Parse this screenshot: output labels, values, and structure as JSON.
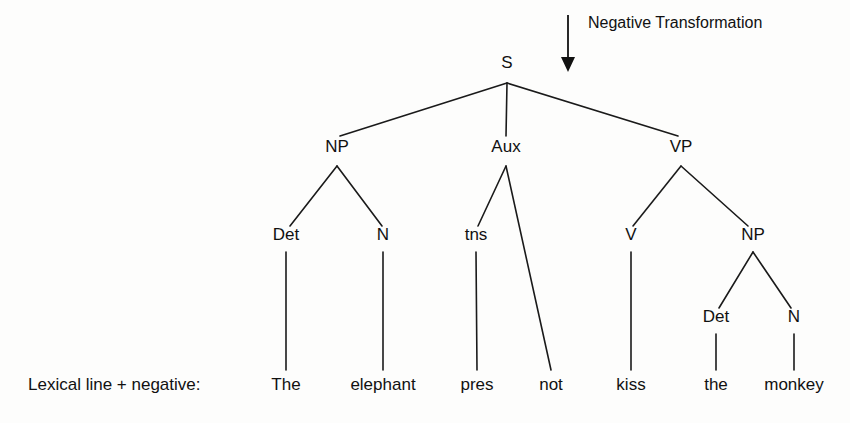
{
  "figure": {
    "background_color": "#fdfdfc",
    "ink_color": "#111111"
  },
  "annotation": {
    "label": "Negative Transformation",
    "label_x": 588,
    "label_y": 28,
    "arrow": {
      "name": "down-arrow",
      "x": 568,
      "y_start": 15,
      "y_end": 72
    }
  },
  "row_label": {
    "text": "Lexical line + negative:",
    "x": 28,
    "y": 390
  },
  "nodes": [
    {
      "id": "S",
      "label": "S",
      "x": 507,
      "y": 68,
      "type": "category"
    },
    {
      "id": "NP1",
      "label": "NP",
      "x": 337,
      "y": 152,
      "type": "category"
    },
    {
      "id": "Aux",
      "label": "Aux",
      "x": 506,
      "y": 152,
      "type": "category"
    },
    {
      "id": "VP",
      "label": "VP",
      "x": 681,
      "y": 152,
      "type": "category"
    },
    {
      "id": "Det1",
      "label": "Det",
      "x": 286,
      "y": 240,
      "type": "category"
    },
    {
      "id": "N1",
      "label": "N",
      "x": 383,
      "y": 240,
      "type": "category"
    },
    {
      "id": "tns",
      "label": "tns",
      "x": 476,
      "y": 240,
      "type": "category"
    },
    {
      "id": "V",
      "label": "V",
      "x": 631,
      "y": 240,
      "type": "category"
    },
    {
      "id": "NP2",
      "label": "NP",
      "x": 753,
      "y": 240,
      "type": "category"
    },
    {
      "id": "Det2",
      "label": "Det",
      "x": 716,
      "y": 322,
      "type": "category"
    },
    {
      "id": "N2",
      "label": "N",
      "x": 794,
      "y": 322,
      "type": "category"
    },
    {
      "id": "w_the1",
      "label": "The",
      "x": 286,
      "y": 390,
      "type": "terminal"
    },
    {
      "id": "w_eleph",
      "label": "elephant",
      "x": 383,
      "y": 390,
      "type": "terminal"
    },
    {
      "id": "w_pres",
      "label": "pres",
      "x": 477,
      "y": 390,
      "type": "terminal"
    },
    {
      "id": "w_not",
      "label": "not",
      "x": 551,
      "y": 390,
      "type": "terminal"
    },
    {
      "id": "w_kiss",
      "label": "kiss",
      "x": 631,
      "y": 390,
      "type": "terminal"
    },
    {
      "id": "w_the2",
      "label": "the",
      "x": 716,
      "y": 390,
      "type": "terminal"
    },
    {
      "id": "w_monkey",
      "label": "monkey",
      "x": 794,
      "y": 390,
      "type": "terminal"
    }
  ],
  "edges": [
    {
      "from": "S",
      "to": "NP1",
      "x1": 507,
      "y1": 83,
      "x2": 340,
      "y2": 136
    },
    {
      "from": "S",
      "to": "Aux",
      "x1": 507,
      "y1": 83,
      "x2": 506,
      "y2": 136
    },
    {
      "from": "S",
      "to": "VP",
      "x1": 507,
      "y1": 83,
      "x2": 678,
      "y2": 136
    },
    {
      "from": "NP1",
      "to": "Det1",
      "x1": 337,
      "y1": 166,
      "x2": 290,
      "y2": 226
    },
    {
      "from": "NP1",
      "to": "N1",
      "x1": 337,
      "y1": 166,
      "x2": 382,
      "y2": 226
    },
    {
      "from": "Aux",
      "to": "tns",
      "x1": 506,
      "y1": 166,
      "x2": 478,
      "y2": 226
    },
    {
      "from": "Aux",
      "to": "w_not",
      "x1": 506,
      "y1": 166,
      "x2": 551,
      "y2": 370
    },
    {
      "from": "VP",
      "to": "V",
      "x1": 681,
      "y1": 166,
      "x2": 633,
      "y2": 226
    },
    {
      "from": "VP",
      "to": "NP2",
      "x1": 681,
      "y1": 166,
      "x2": 748,
      "y2": 226
    },
    {
      "from": "NP2",
      "to": "Det2",
      "x1": 753,
      "y1": 252,
      "x2": 719,
      "y2": 308
    },
    {
      "from": "NP2",
      "to": "N2",
      "x1": 753,
      "y1": 252,
      "x2": 791,
      "y2": 308
    },
    {
      "from": "Det1",
      "to": "w_the1",
      "x1": 286,
      "y1": 252,
      "x2": 286,
      "y2": 370
    },
    {
      "from": "N1",
      "to": "w_eleph",
      "x1": 383,
      "y1": 252,
      "x2": 383,
      "y2": 370
    },
    {
      "from": "tns",
      "to": "w_pres",
      "x1": 476,
      "y1": 252,
      "x2": 477,
      "y2": 370
    },
    {
      "from": "V",
      "to": "w_kiss",
      "x1": 631,
      "y1": 252,
      "x2": 631,
      "y2": 370
    },
    {
      "from": "Det2",
      "to": "w_the2",
      "x1": 716,
      "y1": 334,
      "x2": 716,
      "y2": 370
    },
    {
      "from": "N2",
      "to": "w_monkey",
      "x1": 794,
      "y1": 334,
      "x2": 794,
      "y2": 370
    }
  ],
  "sentence": "The elephant pres not kiss the monkey"
}
